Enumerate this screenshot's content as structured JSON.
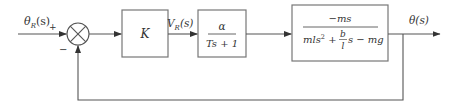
{
  "diagram": {
    "type": "block-diagram",
    "input": {
      "symbol": "θ",
      "subscript": "R",
      "arg": "(s)",
      "label": "θR(s)"
    },
    "output": {
      "symbol": "θ",
      "arg": "(s)",
      "label": "θ(s)"
    },
    "summing_junction": {
      "plus_sign": "+",
      "minus_sign": "−"
    },
    "blocks": [
      {
        "id": "gain",
        "label": "K"
      },
      {
        "id": "actuator",
        "numerator": "α",
        "denominator": "Ts + 1"
      },
      {
        "id": "plant",
        "numerator": "−ms",
        "denominator_parts": {
          "a": "mls",
          "a_exp": "2",
          "plus": " + ",
          "frac_num": "b",
          "frac_den": "l",
          "rest": "s − mg"
        },
        "denominator": "mls² + (b/l)s − mg"
      }
    ],
    "signals": [
      {
        "id": "vr",
        "symbol": "V",
        "subscript": "R",
        "arg": "(s)",
        "label": "VR(s)"
      }
    ],
    "feedback": "unity negative feedback from θ(s) to summing junction"
  },
  "colors": {
    "line": "#555555",
    "box_border": "#777777",
    "text": "#333333",
    "background": "#ffffff"
  }
}
